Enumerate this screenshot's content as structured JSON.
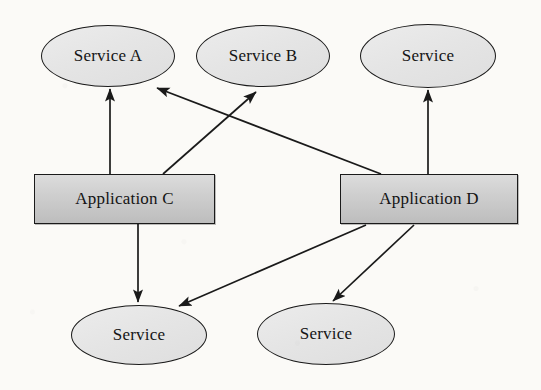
{
  "diagram": {
    "background_color": "#fbfaf7",
    "stroke_color": "#1a1a1a",
    "service_fill": "#e7e7e7",
    "application_fill": "#cfcfcf",
    "nodes": [
      {
        "id": "service-a",
        "label": "Service A",
        "type": "service",
        "cx": 108,
        "cy": 56,
        "rx": 67,
        "ry": 31
      },
      {
        "id": "service-b",
        "label": "Service B",
        "type": "service",
        "cx": 263,
        "cy": 56,
        "rx": 67,
        "ry": 31
      },
      {
        "id": "service-top-3",
        "label": "Service",
        "type": "service",
        "cx": 428,
        "cy": 56,
        "rx": 68,
        "ry": 32
      },
      {
        "id": "application-c",
        "label": "Application C",
        "type": "application",
        "x": 34,
        "y": 174,
        "w": 181,
        "h": 50
      },
      {
        "id": "application-d",
        "label": "Application D",
        "type": "application",
        "x": 340,
        "y": 174,
        "w": 178,
        "h": 50
      },
      {
        "id": "service-bottom-1",
        "label": "Service",
        "type": "service",
        "cx": 139,
        "cy": 335,
        "rx": 68,
        "ry": 30
      },
      {
        "id": "service-bottom-2",
        "label": "Service",
        "type": "service",
        "cx": 326,
        "cy": 334,
        "rx": 69,
        "ry": 31
      }
    ],
    "edges": [
      {
        "id": "edge-appc-to-servicea",
        "from": "application-c",
        "to": "service-a",
        "x1": 110,
        "y1": 174,
        "x2": 110,
        "y2": 89,
        "arrow": "end"
      },
      {
        "id": "edge-appc-to-serviceb",
        "from": "application-c",
        "to": "service-b",
        "x1": 163,
        "y1": 174,
        "x2": 256,
        "y2": 92,
        "arrow": "end"
      },
      {
        "id": "edge-appd-to-servicea",
        "from": "application-d",
        "to": "service-a",
        "x1": 381,
        "y1": 174,
        "x2": 157,
        "y2": 88,
        "arrow": "end"
      },
      {
        "id": "edge-appd-to-servicetop3",
        "from": "application-d",
        "to": "service-top-3",
        "x1": 428,
        "y1": 174,
        "x2": 428,
        "y2": 90,
        "arrow": "end"
      },
      {
        "id": "edge-appc-to-servicebottom1",
        "from": "application-c",
        "to": "service-bottom-1",
        "x1": 138,
        "y1": 224,
        "x2": 138,
        "y2": 302,
        "arrow": "end"
      },
      {
        "id": "edge-appd-to-servicebottom1",
        "from": "application-d",
        "to": "service-bottom-1",
        "x1": 366,
        "y1": 225,
        "x2": 179,
        "y2": 306,
        "arrow": "end"
      },
      {
        "id": "edge-appd-to-servicebottom2",
        "from": "application-d",
        "to": "service-bottom-2",
        "x1": 414,
        "y1": 225,
        "x2": 333,
        "y2": 301,
        "arrow": "end"
      }
    ]
  }
}
